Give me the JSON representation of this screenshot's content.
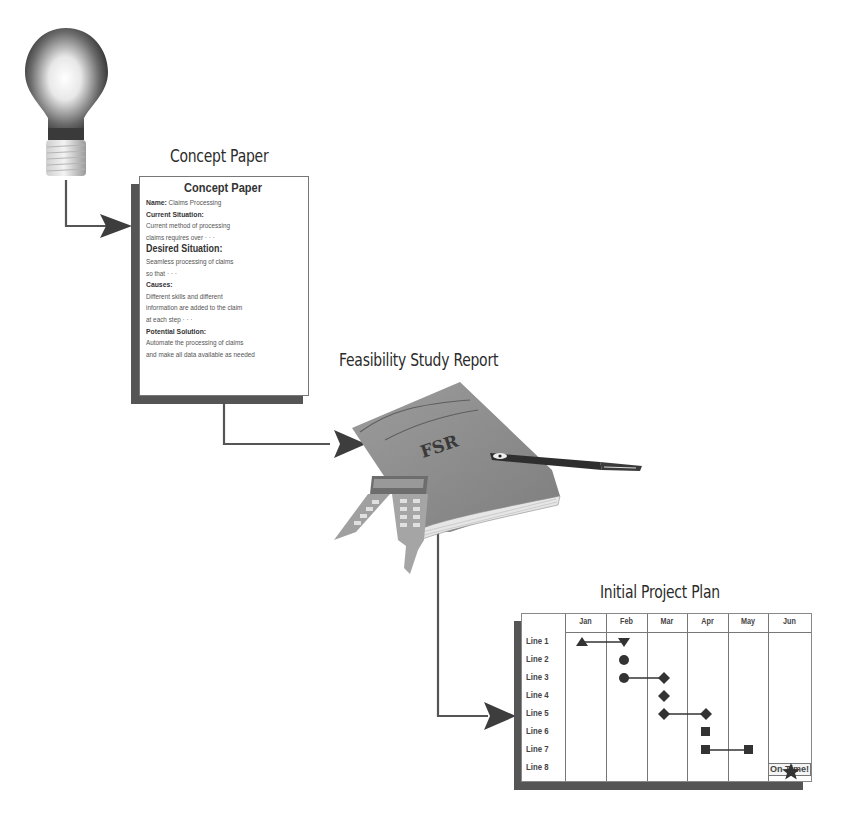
{
  "diagram": {
    "stages": [
      {
        "id": "idea",
        "label": "",
        "icon": "lightbulb-icon"
      },
      {
        "id": "concept",
        "label": "Concept Paper"
      },
      {
        "id": "fsr",
        "label": "Feasibility Study Report",
        "cover_text": "FSR"
      },
      {
        "id": "plan",
        "label": "Initial Project Plan"
      }
    ],
    "connectors": [
      {
        "from": "idea",
        "to": "concept"
      },
      {
        "from": "concept",
        "to": "fsr"
      },
      {
        "from": "fsr",
        "to": "plan"
      }
    ]
  },
  "concept_paper": {
    "heading": "Concept Paper",
    "lines": [
      {
        "label": "Name:",
        "text": "Claims Processing"
      },
      {
        "label": "Current Situation:",
        "text": ""
      },
      {
        "label": "",
        "text": "Current method of processing"
      },
      {
        "label": "",
        "text": "claims requires over · · ·"
      },
      {
        "label": "Desired Situation:",
        "text": "",
        "big": true
      },
      {
        "label": "",
        "text": "Seamless processing of claims"
      },
      {
        "label": "",
        "text": "so that · · ·"
      },
      {
        "label": "Causes:",
        "text": ""
      },
      {
        "label": "",
        "text": "Different skills and different"
      },
      {
        "label": "",
        "text": "information are added to the claim"
      },
      {
        "label": "",
        "text": "at each step · · ·"
      },
      {
        "label": "Potential Solution:",
        "text": ""
      },
      {
        "label": "",
        "text": "Automate the processing of claims"
      },
      {
        "label": "",
        "text": "and make all data available as needed"
      }
    ]
  },
  "project_plan": {
    "months": [
      "Jan",
      "Feb",
      "Mar",
      "Apr",
      "May",
      "Jun"
    ],
    "rows": [
      "Line 1",
      "Line 2",
      "Line 3",
      "Line 4",
      "Line 5",
      "Line 6",
      "Line 7",
      "Line 8"
    ],
    "status_label": "On Time!",
    "status_icon": "star-icon"
  },
  "chart_data": {
    "type": "table",
    "title": "Initial Project Plan",
    "columns": [
      "Jan",
      "Feb",
      "Mar",
      "Apr",
      "May",
      "Jun"
    ],
    "rows": [
      {
        "label": "Line 1",
        "start": "Jan",
        "end": "Feb",
        "marker": "triangle"
      },
      {
        "label": "Line 2",
        "start": "Feb",
        "end": "Feb",
        "marker": "circle"
      },
      {
        "label": "Line 3",
        "start": "Feb",
        "end": "Mar",
        "marker": "circle-to-diamond"
      },
      {
        "label": "Line 4",
        "start": "Mar",
        "end": "Mar",
        "marker": "diamond"
      },
      {
        "label": "Line 5",
        "start": "Mar",
        "end": "Apr",
        "marker": "diamond"
      },
      {
        "label": "Line 6",
        "start": "Apr",
        "end": "Apr",
        "marker": "square"
      },
      {
        "label": "Line 7",
        "start": "Apr",
        "end": "May",
        "marker": "square",
        "note": "On Time!"
      },
      {
        "label": "Line 8",
        "start": "Jun",
        "end": "Jun",
        "marker": "star"
      }
    ]
  }
}
